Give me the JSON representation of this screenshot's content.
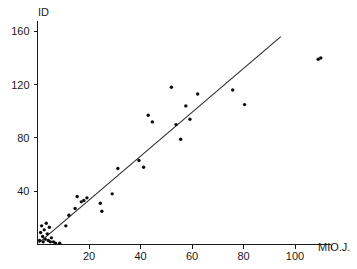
{
  "chart_data": {
    "type": "scatter",
    "title": "",
    "xlabel": "MIO.J.",
    "ylabel": "ID",
    "xlim": [
      0,
      114
    ],
    "ylim": [
      0,
      168
    ],
    "grid": false,
    "legend": null,
    "xticks": [
      20,
      40,
      60,
      80,
      100
    ],
    "yticks": [
      40,
      80,
      120,
      160
    ],
    "xtick_labels": [
      "20",
      "40",
      "60",
      "80",
      "100"
    ],
    "ytick_labels": [
      "40",
      "80",
      "120",
      "160"
    ],
    "series": [
      {
        "name": "observations",
        "marker": "dot",
        "color": "#0d0d0d",
        "points": [
          [
            0.8,
            3
          ],
          [
            1.2,
            9
          ],
          [
            1.6,
            14
          ],
          [
            2.0,
            6
          ],
          [
            2.2,
            2
          ],
          [
            2.6,
            11
          ],
          [
            3.0,
            4
          ],
          [
            3.4,
            16
          ],
          [
            3.8,
            8
          ],
          [
            4.2,
            3
          ],
          [
            4.6,
            13
          ],
          [
            5.0,
            2
          ],
          [
            5.4,
            5
          ],
          [
            6.2,
            2
          ],
          [
            7.0,
            1
          ],
          [
            8.6,
            1
          ],
          [
            11.0,
            14
          ],
          [
            12.2,
            22
          ],
          [
            14.6,
            27
          ],
          [
            15.4,
            36
          ],
          [
            17.0,
            32
          ],
          [
            18.0,
            33
          ],
          [
            19.2,
            35
          ],
          [
            24.4,
            31
          ],
          [
            25.0,
            25
          ],
          [
            29.0,
            38
          ],
          [
            31.2,
            57
          ],
          [
            39.4,
            63
          ],
          [
            41.2,
            58
          ],
          [
            43.0,
            97
          ],
          [
            44.6,
            92
          ],
          [
            52.0,
            118
          ],
          [
            53.8,
            90
          ],
          [
            55.6,
            79
          ],
          [
            57.6,
            104
          ],
          [
            59.2,
            94
          ],
          [
            62.2,
            113
          ],
          [
            75.8,
            116
          ],
          [
            80.4,
            105
          ],
          [
            109.0,
            139
          ],
          [
            110.0,
            140
          ]
        ]
      }
    ],
    "fit_line": {
      "name": "regression-line",
      "x_start": 0.4,
      "y_start": 1,
      "x_end": 94.5,
      "y_end": 156,
      "color": "#2b2b2b"
    }
  }
}
